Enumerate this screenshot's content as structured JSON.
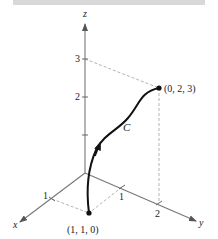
{
  "figure": {
    "axes": {
      "x": {
        "label": "x",
        "ticks": [
          "1"
        ]
      },
      "y": {
        "label": "y",
        "ticks": [
          "1",
          "2"
        ]
      },
      "z": {
        "label": "z",
        "ticks": [
          "1",
          "2",
          "3"
        ]
      }
    },
    "curve": {
      "label": "C"
    },
    "points": {
      "start": {
        "label": "(1, 1, 0)"
      },
      "end": {
        "label": "(0, 2, 3)"
      }
    }
  },
  "colors": {
    "axis": "#777777",
    "curve": "#111111",
    "dashed": "#aaaaaa",
    "topbar": "#d8d8d8"
  }
}
